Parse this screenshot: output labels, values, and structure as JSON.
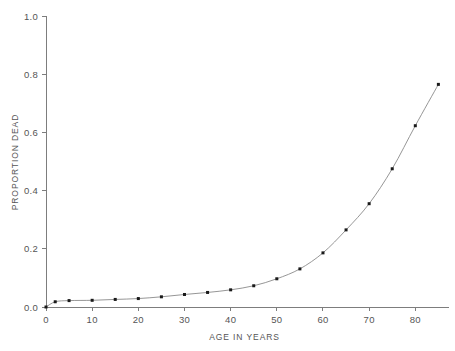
{
  "chart_data": {
    "type": "line",
    "title": "",
    "subtitle": "",
    "xlabel": "AGE IN YEARS",
    "ylabel": "PROPORTION DEAD",
    "xlim": [
      0,
      86
    ],
    "ylim": [
      0,
      1.0
    ],
    "grid": false,
    "legend": null,
    "legend_position": "none",
    "marker": "square",
    "x_ticks": [
      0,
      10,
      20,
      30,
      40,
      50,
      60,
      70,
      80
    ],
    "x_tick_labels": [
      "0",
      "10",
      "20",
      "30",
      "40",
      "50",
      "60",
      "70",
      "80"
    ],
    "y_ticks": [
      0.0,
      0.2,
      0.4,
      0.6,
      0.8,
      1.0
    ],
    "y_tick_labels": [
      "0.0",
      "0.2",
      "0.4",
      "0.6",
      "0.8",
      "1.0"
    ],
    "x": [
      0,
      2,
      5,
      10,
      15,
      20,
      25,
      30,
      35,
      40,
      45,
      50,
      55,
      60,
      65,
      70,
      75,
      80,
      85
    ],
    "values": [
      0.0,
      0.018,
      0.022,
      0.023,
      0.026,
      0.029,
      0.035,
      0.043,
      0.05,
      0.059,
      0.073,
      0.097,
      0.131,
      0.186,
      0.265,
      0.355,
      0.475,
      0.623,
      0.765
    ],
    "series": [
      {
        "name": "proportion dead",
        "values": [
          0.0,
          0.018,
          0.022,
          0.023,
          0.026,
          0.029,
          0.035,
          0.043,
          0.05,
          0.059,
          0.073,
          0.097,
          0.131,
          0.186,
          0.265,
          0.355,
          0.475,
          0.623,
          0.765
        ],
        "color": "#8a8a8a",
        "marker_color": "#1a1a1a"
      }
    ]
  },
  "colors": {
    "background": "#ffffff",
    "axis": "#7d7d7d",
    "line": "#8a8a8a",
    "marker": "#1a1a1a",
    "text": "#555555"
  }
}
